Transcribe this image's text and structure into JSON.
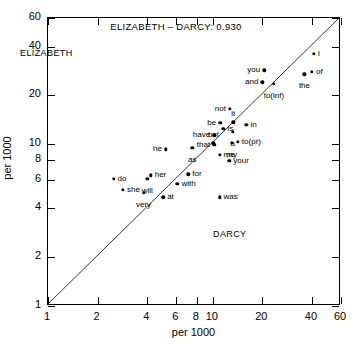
{
  "chart_data": {
    "type": "scatter",
    "title": "ELIZABETH – DARCY: 0.930",
    "xlabel": "per 1000",
    "ylabel": "per 1000",
    "xscale": "log",
    "yscale": "log",
    "xlim": [
      1,
      60
    ],
    "ylim": [
      1,
      60
    ],
    "grid": false,
    "legend": "none",
    "annotations": [
      {
        "text": "ELIZABETH",
        "corner": "top-left"
      },
      {
        "text": "DARCY",
        "corner": "bottom-right"
      }
    ],
    "reference_line": {
      "type": "identity",
      "from": [
        1,
        1
      ],
      "to": [
        60,
        60
      ]
    },
    "xticks": [
      1,
      2,
      4,
      6,
      8,
      10,
      20,
      40,
      60
    ],
    "xticklabels": [
      "1",
      "2",
      "4",
      "6",
      "8",
      "10",
      "20",
      "40",
      "60"
    ],
    "yticks": [
      1,
      2,
      4,
      6,
      8,
      10,
      20,
      40,
      60
    ],
    "yticklabels": [
      "1",
      "2",
      "4",
      "6",
      "8",
      "10",
      "20",
      "40",
      "60"
    ],
    "points": [
      {
        "label": "I",
        "x": 41.0,
        "y": 36.0,
        "pos": "rgt"
      },
      {
        "label": "you",
        "x": 20.5,
        "y": 28.5,
        "pos": "lft"
      },
      {
        "label": "of",
        "x": 40.0,
        "y": 28.0,
        "pos": "rgt"
      },
      {
        "label": "the",
        "x": 36.0,
        "y": 27.0,
        "pos": "bot"
      },
      {
        "label": "and",
        "x": 20.0,
        "y": 24.0,
        "pos": "lft"
      },
      {
        "label": "to(inf)",
        "x": 23.5,
        "y": 23.5,
        "pos": "bot"
      },
      {
        "label": "not",
        "x": 12.7,
        "y": 16.5,
        "pos": "lft"
      },
      {
        "label": "it",
        "x": 13.3,
        "y": 13.6,
        "pos": "top"
      },
      {
        "label": "be",
        "x": 11.1,
        "y": 13.5,
        "pos": "lft"
      },
      {
        "label": "in",
        "x": 16.0,
        "y": 13.2,
        "pos": "rgt"
      },
      {
        "label": "is",
        "x": 11.6,
        "y": 12.4,
        "pos": "rgt"
      },
      {
        "label": "a",
        "x": 13.2,
        "y": 11.9,
        "pos": "bot"
      },
      {
        "label": "have",
        "x": 10.2,
        "y": 11.3,
        "pos": "lft"
      },
      {
        "label": "but",
        "x": 10.1,
        "y": 10.1,
        "pos": "top"
      },
      {
        "label": "that",
        "x": 10.2,
        "y": 9.9,
        "pos": "lft"
      },
      {
        "label": "to(pr)",
        "x": 14.2,
        "y": 10.3,
        "pos": "rgt"
      },
      {
        "label": "my",
        "x": 13.0,
        "y": 10.2,
        "pos": "bot"
      },
      {
        "label": "he",
        "x": 5.2,
        "y": 9.3,
        "pos": "lft"
      },
      {
        "label": "as",
        "x": 7.5,
        "y": 9.5,
        "pos": "bot"
      },
      {
        "label": "me",
        "x": 11.0,
        "y": 8.6,
        "pos": "rgt"
      },
      {
        "label": "your",
        "x": 12.6,
        "y": 7.9,
        "pos": "rgt"
      },
      {
        "label": "for",
        "x": 7.1,
        "y": 6.5,
        "pos": "rgt"
      },
      {
        "label": "her",
        "x": 4.2,
        "y": 6.4,
        "pos": "rgt"
      },
      {
        "label": "will",
        "x": 4.0,
        "y": 6.1,
        "pos": "bot"
      },
      {
        "label": "do",
        "x": 2.5,
        "y": 6.1,
        "pos": "rgt"
      },
      {
        "label": "with",
        "x": 6.1,
        "y": 5.7,
        "pos": "rgt"
      },
      {
        "label": "she",
        "x": 2.85,
        "y": 5.2,
        "pos": "rgt"
      },
      {
        "label": "very",
        "x": 3.8,
        "y": 5.0,
        "pos": "bot"
      },
      {
        "label": "at",
        "x": 5.0,
        "y": 4.7,
        "pos": "rgt"
      },
      {
        "label": "was",
        "x": 11.0,
        "y": 4.7,
        "pos": "rgt"
      }
    ]
  }
}
